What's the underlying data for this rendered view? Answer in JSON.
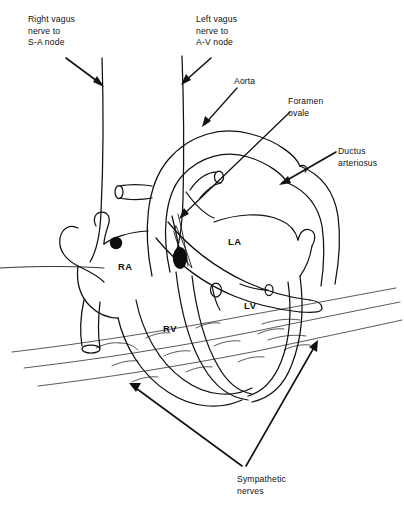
{
  "figure": {
    "background_color": "#ffffff",
    "line_color": "#111111",
    "width": 404,
    "height": 508
  },
  "labels": {
    "right_vagus": "Right vagus\nnerve to\nS-A node",
    "left_vagus": "Left vagus\nnerve to\nA-V node",
    "aorta": "Aorta",
    "foramen_ovale": "Foramen\novale",
    "ductus_arteriosus": "Ductus\narteriosus",
    "sympathetic_nerves": "Sympathetic\nnerves"
  },
  "chambers": {
    "right_atrium": "RA",
    "left_atrium": "LA",
    "right_ventricle": "RV",
    "left_ventricle": "LV"
  },
  "nodes": {
    "sa_node": "S-A node",
    "av_node": "A-V node"
  },
  "callouts": [
    {
      "name": "right-vagus",
      "text": "Right vagus nerve to S-A node",
      "x": 28,
      "y": 14
    },
    {
      "name": "left-vagus",
      "text": "Left vagus nerve to A-V node",
      "x": 196,
      "y": 14
    },
    {
      "name": "aorta",
      "text": "Aorta",
      "x": 234,
      "y": 76
    },
    {
      "name": "foramen-ovale",
      "text": "Foramen ovale",
      "x": 288,
      "y": 96
    },
    {
      "name": "ductus-arteriosus",
      "text": "Ductus arteriosus",
      "x": 338,
      "y": 146
    },
    {
      "name": "sympathetic-nerves",
      "text": "Sympathetic nerves",
      "x": 237,
      "y": 474
    }
  ]
}
